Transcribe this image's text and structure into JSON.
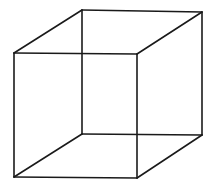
{
  "figure": {
    "kind": "necker-cube",
    "background": "#ffffff",
    "stroke_color": "#1a1a1a",
    "vertices": {
      "front_top_left": [
        14,
        53
      ],
      "front_top_right": [
        137,
        54
      ],
      "front_bottom_left": [
        14,
        177
      ],
      "front_bottom_right": [
        137,
        178
      ],
      "back_top_left": [
        82,
        10
      ],
      "back_top_right": [
        202,
        12
      ],
      "back_bottom_left": [
        82,
        134
      ],
      "back_bottom_right": [
        202,
        135
      ]
    },
    "edges": [
      [
        "front_top_left",
        "front_top_right"
      ],
      [
        "front_top_right",
        "front_bottom_right"
      ],
      [
        "front_bottom_right",
        "front_bottom_left"
      ],
      [
        "front_bottom_left",
        "front_top_left"
      ],
      [
        "back_top_left",
        "back_top_right"
      ],
      [
        "back_top_right",
        "back_bottom_right"
      ],
      [
        "back_bottom_right",
        "back_bottom_left"
      ],
      [
        "back_bottom_left",
        "back_top_left"
      ],
      [
        "front_top_left",
        "back_top_left"
      ],
      [
        "front_top_right",
        "back_top_right"
      ],
      [
        "front_bottom_left",
        "back_bottom_left"
      ],
      [
        "front_bottom_right",
        "back_bottom_right"
      ]
    ]
  }
}
